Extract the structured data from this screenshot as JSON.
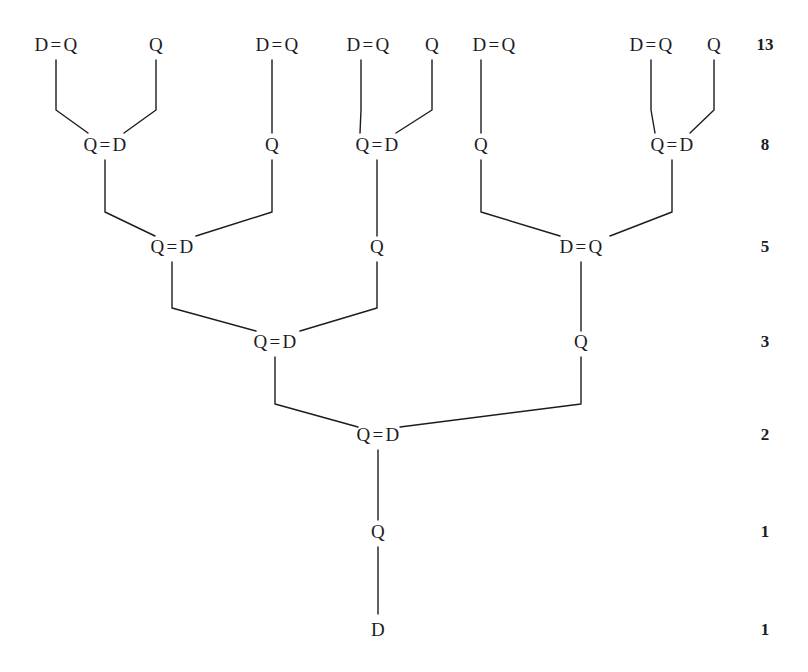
{
  "diagram": {
    "ink_color": "#1b1b24",
    "background_color": "#ffffff",
    "symbols": {
      "adult": "D",
      "juvenile": "Q",
      "link": "="
    },
    "levels": [
      {
        "index": 0,
        "y": 44,
        "count_label": "13",
        "nodes": [
          {
            "text": "D = Q",
            "x": 56
          },
          {
            "text": "Q",
            "x": 156
          },
          {
            "text": "D = Q",
            "x": 277
          },
          {
            "text": "D = Q",
            "x": 368
          },
          {
            "text": "Q",
            "x": 432
          },
          {
            "text": "D = Q",
            "x": 494
          },
          {
            "text": "D = Q",
            "x": 651
          },
          {
            "text": "Q",
            "x": 714
          }
        ]
      },
      {
        "index": 1,
        "y": 144,
        "count_label": "8",
        "nodes": [
          {
            "text": "Q = D",
            "x": 105
          },
          {
            "text": "Q",
            "x": 272
          },
          {
            "text": "Q = D",
            "x": 377
          },
          {
            "text": "Q",
            "x": 481
          },
          {
            "text": "Q = D",
            "x": 672
          }
        ]
      },
      {
        "index": 2,
        "y": 246,
        "count_label": "5",
        "nodes": [
          {
            "text": "Q = D",
            "x": 172
          },
          {
            "text": "Q",
            "x": 377
          },
          {
            "text": "D = Q",
            "x": 581
          }
        ]
      },
      {
        "index": 3,
        "y": 341,
        "count_label": "3",
        "nodes": [
          {
            "text": "Q = D",
            "x": 275
          },
          {
            "text": "Q",
            "x": 581
          }
        ]
      },
      {
        "index": 4,
        "y": 434,
        "count_label": "2",
        "nodes": [
          {
            "text": "Q = D",
            "x": 378
          }
        ]
      },
      {
        "index": 5,
        "y": 531,
        "count_label": "1",
        "nodes": [
          {
            "text": "Q",
            "x": 378
          }
        ]
      },
      {
        "index": 6,
        "y": 629,
        "count_label": "1",
        "nodes": [
          {
            "text": "D",
            "x": 378
          }
        ]
      }
    ],
    "counts_column_x": 765,
    "edges": [
      {
        "from": [
          56,
          60
        ],
        "mid": [
          56,
          110
        ],
        "to": [
          88,
          133
        ]
      },
      {
        "from": [
          156,
          60
        ],
        "mid": [
          156,
          110
        ],
        "to": [
          124,
          133
        ]
      },
      {
        "from": [
          272,
          60
        ],
        "mid": [
          272,
          133
        ],
        "to": [
          272,
          133
        ]
      },
      {
        "from": [
          361,
          60
        ],
        "mid": [
          361,
          110
        ],
        "to": [
          360,
          133
        ]
      },
      {
        "from": [
          432,
          60
        ],
        "mid": [
          432,
          110
        ],
        "to": [
          396,
          133
        ]
      },
      {
        "from": [
          481,
          60
        ],
        "mid": [
          481,
          133
        ],
        "to": [
          481,
          133
        ]
      },
      {
        "from": [
          651,
          60
        ],
        "mid": [
          651,
          110
        ],
        "to": [
          655,
          133
        ]
      },
      {
        "from": [
          714,
          60
        ],
        "mid": [
          714,
          110
        ],
        "to": [
          690,
          133
        ]
      },
      {
        "from": [
          105,
          160
        ],
        "mid": [
          105,
          212
        ],
        "to": [
          155,
          236
        ]
      },
      {
        "from": [
          272,
          160
        ],
        "mid": [
          272,
          212
        ],
        "to": [
          196,
          236
        ]
      },
      {
        "from": [
          377,
          160
        ],
        "mid": [
          377,
          236
        ],
        "to": [
          377,
          236
        ]
      },
      {
        "from": [
          481,
          160
        ],
        "mid": [
          481,
          212
        ],
        "to": [
          560,
          236
        ]
      },
      {
        "from": [
          672,
          160
        ],
        "mid": [
          672,
          212
        ],
        "to": [
          610,
          236
        ]
      },
      {
        "from": [
          172,
          262
        ],
        "mid": [
          172,
          308
        ],
        "to": [
          256,
          331
        ]
      },
      {
        "from": [
          377,
          262
        ],
        "mid": [
          377,
          308
        ],
        "to": [
          300,
          331
        ]
      },
      {
        "from": [
          581,
          262
        ],
        "mid": [
          581,
          331
        ],
        "to": [
          581,
          331
        ]
      },
      {
        "from": [
          275,
          357
        ],
        "mid": [
          275,
          404
        ],
        "to": [
          358,
          427
        ]
      },
      {
        "from": [
          581,
          357
        ],
        "mid": [
          581,
          404
        ],
        "to": [
          400,
          427
        ]
      },
      {
        "from": [
          378,
          450
        ],
        "mid": [
          378,
          520
        ],
        "to": [
          378,
          520
        ]
      },
      {
        "from": [
          378,
          547
        ],
        "mid": [
          378,
          614
        ],
        "to": [
          378,
          614
        ]
      }
    ]
  }
}
